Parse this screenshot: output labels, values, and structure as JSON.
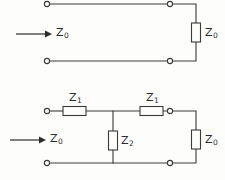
{
  "figure": {
    "background_color": "#fdfdfc",
    "line_color": "#3a3a3a",
    "text_color": "#2b2b2b"
  },
  "circuits": [
    {
      "id": "matched-line",
      "name": "Transmission line terminated in characteristic impedance",
      "input_arrow_label": {
        "symbol": "Z",
        "subscript": "0"
      },
      "components": [
        {
          "ref": "Z0-load",
          "symbol": "Z",
          "subscript": "0",
          "type": "resistor",
          "orientation": "vertical",
          "position": "right-shunt-termination"
        }
      ],
      "terminals": [
        {
          "name": "input-top",
          "x": 47,
          "y": 4
        },
        {
          "name": "input-bottom",
          "x": 47,
          "y": 61
        },
        {
          "name": "output-top",
          "x": 170,
          "y": 4
        },
        {
          "name": "output-bottom",
          "x": 170,
          "y": 61
        }
      ]
    },
    {
      "id": "tee-network",
      "name": "Symmetric T network terminated in characteristic impedance",
      "input_arrow_label": {
        "symbol": "Z",
        "subscript": "0"
      },
      "components": [
        {
          "ref": "Z1-left",
          "symbol": "Z",
          "subscript": "1",
          "type": "resistor",
          "orientation": "horizontal",
          "position": "series-left"
        },
        {
          "ref": "Z1-right",
          "symbol": "Z",
          "subscript": "1",
          "type": "resistor",
          "orientation": "horizontal",
          "position": "series-right"
        },
        {
          "ref": "Z2-shunt",
          "symbol": "Z",
          "subscript": "2",
          "type": "resistor",
          "orientation": "vertical",
          "position": "shunt-centre"
        },
        {
          "ref": "Z0-load",
          "symbol": "Z",
          "subscript": "0",
          "type": "resistor",
          "orientation": "vertical",
          "position": "right-shunt-termination"
        }
      ],
      "terminals": [
        {
          "name": "input-top",
          "x": 47,
          "y": 111
        },
        {
          "name": "input-bottom",
          "x": 47,
          "y": 163
        },
        {
          "name": "output-top",
          "x": 170,
          "y": 111
        },
        {
          "name": "output-bottom",
          "x": 170,
          "y": 163
        }
      ]
    }
  ],
  "labels": {
    "c1_input": {
      "symbol": "Z",
      "sub": "0"
    },
    "c1_load": {
      "symbol": "Z",
      "sub": "0"
    },
    "c2_input": {
      "symbol": "Z",
      "sub": "0"
    },
    "c2_z1_left": {
      "symbol": "Z",
      "sub": "1"
    },
    "c2_z1_right": {
      "symbol": "Z",
      "sub": "1"
    },
    "c2_z2": {
      "symbol": "Z",
      "sub": "2"
    },
    "c2_load": {
      "symbol": "Z",
      "sub": "0"
    }
  }
}
